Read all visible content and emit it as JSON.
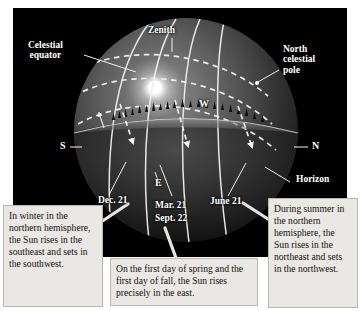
{
  "figure": {
    "panel_background": "#000000",
    "page_background": "#ffffff",
    "label_color": "#ffffff",
    "caption_background": "#e9e8e4",
    "caption_text_color": "#14100c"
  },
  "sphere_labels": {
    "zenith": "Zenith",
    "celestial_equator": "Celestial\nequator",
    "north_celestial_pole": "North\ncelestial\npole",
    "horizon": "Horizon"
  },
  "compass": {
    "south": "S",
    "north": "N",
    "west": "W",
    "east": "E"
  },
  "date_labels": {
    "december": "Dec. 21",
    "march": "Mar. 21",
    "september": "Sept. 22",
    "june": "June 21"
  },
  "captions": {
    "winter": "In winter in the northern hemisphere, the Sun rises in the southeast and sets in the southwest.",
    "equinox": "On the first day of spring and the first day of fall, the Sun rises precisely in the east.",
    "summer": "During summer in the northern hemisphere, the Sun rises in the northeast and sets in the northwest."
  }
}
